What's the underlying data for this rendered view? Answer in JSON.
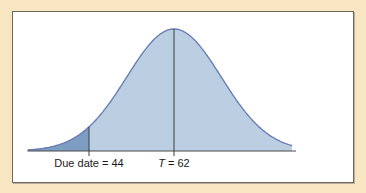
{
  "chart_data": {
    "type": "area",
    "title": "",
    "xlabel": "",
    "ylabel": "",
    "distribution": "normal",
    "mean": 62,
    "std_dev": 10,
    "xlim": [
      31,
      87
    ],
    "shaded_region": {
      "from": 31,
      "to": 44,
      "meaning": "probability of completing by due date"
    },
    "reference_lines": [
      {
        "x": 44,
        "label_prefix": "Due date",
        "label": "Due date = 44"
      },
      {
        "x": 62,
        "label_prefix": "T",
        "label": "T = 62"
      }
    ],
    "labels": {
      "due_date": "Due date = 44",
      "t_var": "T",
      "t_value": " = 62"
    },
    "colors": {
      "background": "#f8e6c3",
      "panel": "#ffffff",
      "curve_fill": "#bccfe2",
      "curve_line": "#6a7eb4",
      "shaded_fill": "#7d9dc2",
      "reference_line": "#3d3d3d"
    }
  }
}
